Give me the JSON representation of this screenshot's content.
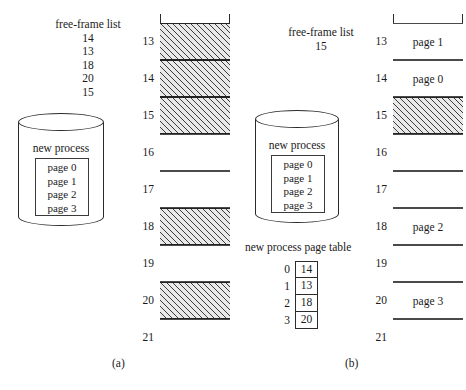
{
  "figure": {
    "type": "paging-free-frame-allocation-diagram"
  },
  "panel_a": {
    "caption": "(a)",
    "free_frame_list": {
      "title": "free-frame list",
      "frames": [
        "14",
        "13",
        "18",
        "20",
        "15"
      ]
    },
    "process": {
      "label": "new process",
      "pages": [
        "page 0",
        "page 1",
        "page 2",
        "page 3"
      ]
    },
    "memory": {
      "frames": [
        {
          "index": "13",
          "content": "",
          "state": "free"
        },
        {
          "index": "14",
          "content": "",
          "state": "free"
        },
        {
          "index": "15",
          "content": "",
          "state": "free"
        },
        {
          "index": "16",
          "content": "",
          "state": "used"
        },
        {
          "index": "17",
          "content": "",
          "state": "used"
        },
        {
          "index": "18",
          "content": "",
          "state": "free"
        },
        {
          "index": "19",
          "content": "",
          "state": "used"
        },
        {
          "index": "20",
          "content": "",
          "state": "free"
        },
        {
          "index": "21",
          "content": "",
          "state": "used"
        }
      ]
    }
  },
  "panel_b": {
    "caption": "(b)",
    "free_frame_list": {
      "title": "free-frame list",
      "frames": [
        "15"
      ]
    },
    "process": {
      "label": "new process",
      "pages": [
        "page 0",
        "page 1",
        "page 2",
        "page 3"
      ]
    },
    "page_table": {
      "title": "new process page table",
      "rows": [
        {
          "index": "0",
          "frame": "14"
        },
        {
          "index": "1",
          "frame": "13"
        },
        {
          "index": "2",
          "frame": "18"
        },
        {
          "index": "3",
          "frame": "20"
        }
      ]
    },
    "memory": {
      "frames": [
        {
          "index": "13",
          "content": "page 1",
          "state": "used"
        },
        {
          "index": "14",
          "content": "page 0",
          "state": "used"
        },
        {
          "index": "15",
          "content": "",
          "state": "free"
        },
        {
          "index": "16",
          "content": "",
          "state": "used"
        },
        {
          "index": "17",
          "content": "",
          "state": "used"
        },
        {
          "index": "18",
          "content": "page 2",
          "state": "used"
        },
        {
          "index": "19",
          "content": "",
          "state": "used"
        },
        {
          "index": "20",
          "content": "page 3",
          "state": "used"
        },
        {
          "index": "21",
          "content": "",
          "state": "used"
        }
      ]
    }
  },
  "colors": {
    "ink": "#1a1a1a",
    "stroke": "#2b2b2b",
    "hatch": "#3c3c3c",
    "background": "#ffffff"
  }
}
